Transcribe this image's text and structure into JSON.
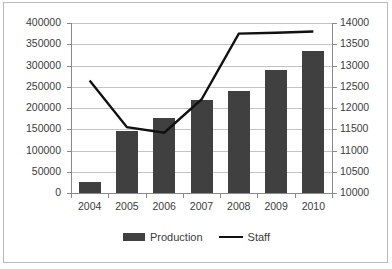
{
  "chart_data": {
    "type": "bar",
    "title": "",
    "xlabel": "",
    "ylabel": "",
    "grid": true,
    "legend_position": "bottom",
    "categories": [
      "2004",
      "2005",
      "2006",
      "2007",
      "2008",
      "2009",
      "2010"
    ],
    "series": [
      {
        "name": "Production",
        "type": "bar",
        "axis": "left",
        "values": [
          27000,
          145000,
          176000,
          220000,
          239000,
          290000,
          335000
        ],
        "color": "#404040"
      },
      {
        "name": "Staff",
        "type": "line",
        "axis": "right",
        "values": [
          12650,
          11550,
          11420,
          12200,
          13750,
          13770,
          13800
        ],
        "color": "#111111"
      }
    ],
    "left_axis": {
      "min": 0,
      "max": 400000,
      "step": 50000,
      "ticks": [
        "0",
        "50000",
        "100000",
        "150000",
        "200000",
        "250000",
        "300000",
        "350000",
        "400000"
      ]
    },
    "right_axis": {
      "min": 10000,
      "max": 14000,
      "step": 500,
      "ticks": [
        "10000",
        "10500",
        "11000",
        "11500",
        "12000",
        "12500",
        "13000",
        "13500",
        "14000"
      ]
    }
  },
  "legend": {
    "items": [
      {
        "label": "Production",
        "marker": "bar-swatch"
      },
      {
        "label": "Staff",
        "marker": "line-swatch"
      }
    ]
  }
}
